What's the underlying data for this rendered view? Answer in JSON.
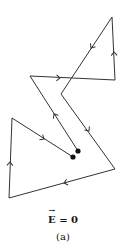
{
  "diagram": {
    "stroke_color": "#333333",
    "dot_color": "#111111",
    "path_points": [
      [
        78,
        151
      ],
      [
        30,
        76
      ],
      [
        115,
        80
      ],
      [
        112,
        17
      ],
      [
        61,
        94
      ],
      [
        115,
        169
      ],
      [
        9,
        198
      ],
      [
        12,
        118
      ],
      [
        73,
        157
      ]
    ],
    "arrows": [
      {
        "x": 54,
        "y": 114,
        "from": [
          78,
          151
        ],
        "to": [
          30,
          76
        ]
      },
      {
        "x": 60,
        "y": 78,
        "from": [
          30,
          76
        ],
        "to": [
          115,
          80
        ]
      },
      {
        "x": 114,
        "y": 52,
        "from": [
          115,
          80
        ],
        "to": [
          112,
          17
        ]
      },
      {
        "x": 91,
        "y": 48,
        "from": [
          112,
          17
        ],
        "to": [
          61,
          94
        ]
      },
      {
        "x": 89,
        "y": 131,
        "from": [
          61,
          94
        ],
        "to": [
          115,
          169
        ]
      },
      {
        "x": 64,
        "y": 183,
        "from": [
          115,
          169
        ],
        "to": [
          9,
          198
        ]
      },
      {
        "x": 10,
        "y": 162,
        "from": [
          9,
          198
        ],
        "to": [
          12,
          118
        ]
      },
      {
        "x": 44,
        "y": 139,
        "from": [
          12,
          118
        ],
        "to": [
          73,
          157
        ]
      }
    ],
    "dots": [
      {
        "name": "start",
        "x": 78,
        "y": 151
      },
      {
        "name": "end",
        "x": 73,
        "y": 157
      }
    ]
  },
  "caption": {
    "symbol": "E",
    "equation_rest": " = 0",
    "label": "(a)"
  }
}
